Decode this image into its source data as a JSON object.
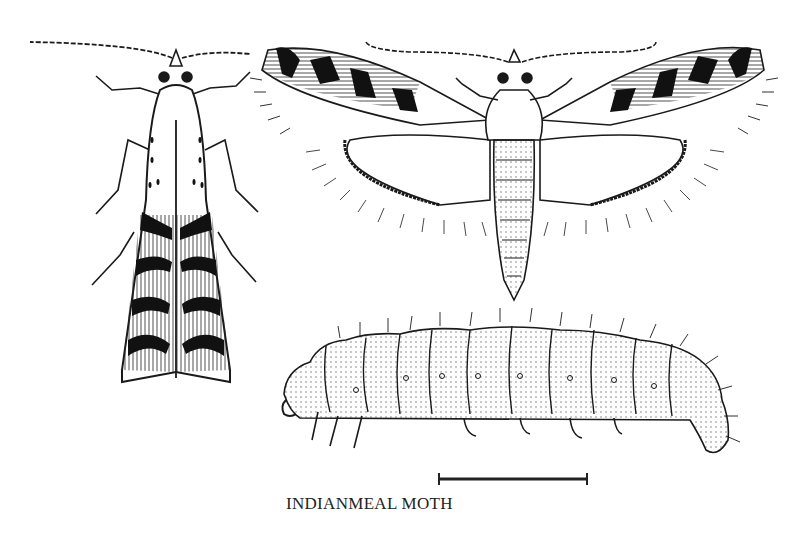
{
  "figure": {
    "title": "INDIANMEAL MOTH",
    "panels": [
      {
        "name": "adult-moth-resting",
        "description": "Adult moth, wings folded, dorsal view"
      },
      {
        "name": "adult-moth-spread",
        "description": "Adult moth, wings spread, dorsal view"
      },
      {
        "name": "larva",
        "description": "Larva (caterpillar), lateral view"
      }
    ],
    "scale_bar": {
      "label": ""
    },
    "colors": {
      "ink": "#1a1a1a",
      "background": "#ffffff"
    }
  }
}
